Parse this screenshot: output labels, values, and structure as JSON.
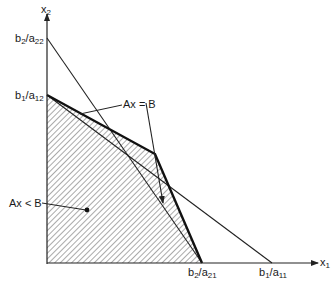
{
  "diagram": {
    "type": "linear-inequality-feasible-region",
    "axes": {
      "x_label": {
        "base": "x",
        "sub": "1"
      },
      "y_label": {
        "base": "x",
        "sub": "2"
      }
    },
    "y_intercepts": [
      {
        "base": "b",
        "sub1": "2",
        "mid": "/a",
        "sub2": "22"
      },
      {
        "base": "b",
        "sub1": "1",
        "mid": "/a",
        "sub2": "12"
      }
    ],
    "x_intercepts": [
      {
        "base": "b",
        "sub1": "2",
        "mid": "/a",
        "sub2": "21"
      },
      {
        "base": "b",
        "sub1": "1",
        "mid": "/a",
        "sub2": "11"
      }
    ],
    "annotations": {
      "boundary": "Ax = B",
      "interior": "Ax < B"
    },
    "colors": {
      "line": "#222222",
      "hatch": "#555555",
      "background": "#ffffff"
    }
  }
}
